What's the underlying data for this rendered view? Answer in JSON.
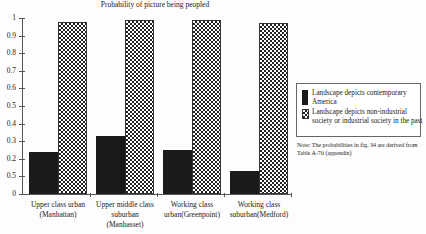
{
  "chart_data": {
    "type": "bar",
    "title": "Probability of picture being peopled",
    "xlabel": "",
    "ylabel": "",
    "ylim": [
      0,
      1
    ],
    "y_ticks": [
      {
        "value": 1,
        "label": "1"
      },
      {
        "value": 0.9,
        "label": "0.9"
      },
      {
        "value": 0.8,
        "label": "0.8"
      },
      {
        "value": 0.7,
        "label": "0.7"
      },
      {
        "value": 0.6,
        "label": "0.6"
      },
      {
        "value": 0.5,
        "label": "0.5"
      },
      {
        "value": 0.4,
        "label": "0.4"
      },
      {
        "value": 0.3,
        "label": "0.3"
      },
      {
        "value": 0.2,
        "label": "0.2"
      },
      {
        "value": 0.1,
        "label": "0.5"
      },
      {
        "value": 0,
        "label": "0"
      }
    ],
    "categories": [
      "Upper class urban (Manhattan)",
      "Upper middle class suburban (Manhasset)",
      "Working class urban(Greenpoint)",
      "Working class suburban(Medford)"
    ],
    "category_lines": [
      [
        "Upper class urban",
        "(Manhattan)"
      ],
      [
        "Upper middle class",
        "suburban",
        "(Manhasset)"
      ],
      [
        "Working class",
        "urban(Greenpoint)"
      ],
      [
        "Working class",
        "suburban(Medford)"
      ]
    ],
    "series": [
      {
        "name": "Landscape depicts contemporary America",
        "pattern": "solid-black",
        "color": "#1a1a1a",
        "values": [
          0.24,
          0.33,
          0.25,
          0.13
        ]
      },
      {
        "name": "Landscape depicts non-industrial society or industrial society in the past",
        "pattern": "checkerboard",
        "color": "#222222",
        "values": [
          0.98,
          0.99,
          0.99,
          0.97
        ]
      }
    ],
    "grid": false,
    "legend_position": "right",
    "annotations": [
      "Note: The probabilities in fig. 34 are derived from Table A-7ii (appendix)"
    ]
  },
  "legend": {
    "item0": "Landscape depicts contemporary America",
    "item1": "Landscape depicts non-industrial society or industrial society in the past"
  },
  "note": "Note: The probabilities in fig. 34 are derived from Table A-7ii (appendix)"
}
